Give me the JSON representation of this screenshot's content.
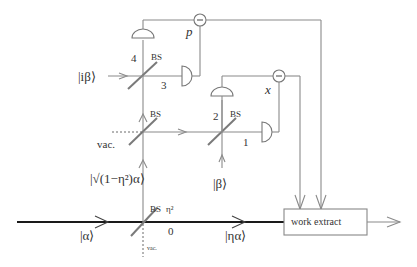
{
  "diagram": {
    "type": "optical-circuit",
    "inputs": {
      "main_input": "|α⟩",
      "ancilla_top": "|iβ⟩",
      "ancilla_mid": "|β⟩",
      "transmitted": "|ηα⟩",
      "reflected": "|√(1−η²)α⟩"
    },
    "beam_splitters": [
      {
        "id": "bs0",
        "label": "BS",
        "param": "η²"
      },
      {
        "id": "bs_mid",
        "label": "BS"
      },
      {
        "id": "bs_right",
        "label": "BS"
      },
      {
        "id": "bs_top",
        "label": "BS"
      }
    ],
    "vacuum_labels": {
      "mid": "vac.",
      "bottom": "vac."
    },
    "port_numbers": {
      "p0": "0",
      "p1": "1",
      "p2": "2",
      "p3": "3",
      "p4": "4"
    },
    "difference_nodes": {
      "p": "p",
      "x": "x",
      "symbol": "−"
    },
    "box": {
      "label": "work extract"
    }
  }
}
